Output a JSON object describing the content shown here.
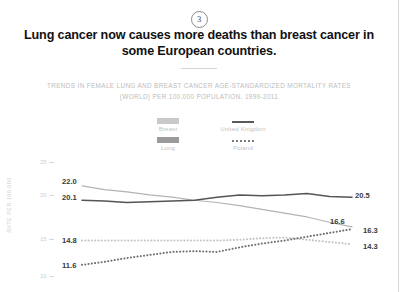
{
  "page": {
    "badge_number": "3",
    "title_line1": "Lung cancer now causes more deaths than breast cancer",
    "title_line2": "in some European countries.",
    "subtitle_line1": "TRENDS IN FEMALE LUNG AND BREAST CANCER AGE-STANDARDIZED MORTALITY RATES",
    "subtitle_line2": "(WORLD) PER 100,000 POPULATION, 1999-2011"
  },
  "legend": {
    "breast_label": "Breast",
    "lung_label": "Lung",
    "uk_label": "United Kingdom",
    "poland_label": "Poland"
  },
  "colors": {
    "breast_swatch": "#c9c9c9",
    "lung_swatch": "#9b9b9b",
    "uk_breast_line": "#b3b3b3",
    "uk_lung_line": "#555555",
    "poland_breast_line": "#c4c4c4",
    "poland_lung_line": "#6e6e6e",
    "axis": "#d8d8d8",
    "text": "#111111",
    "muted": "#c2c2c2"
  },
  "chart_data": {
    "type": "line",
    "title": "Trends in female lung and breast cancer age-standardized mortality rates",
    "xlabel": "",
    "ylabel": "RATE PER 100,000",
    "ylim": [
      9,
      26
    ],
    "yticks": [
      25,
      20,
      15,
      10
    ],
    "ytick_labels": [
      "25",
      "20",
      "15",
      "10"
    ],
    "grid": false,
    "legend_position": "top-center",
    "x": [
      1999,
      2000,
      2001,
      2002,
      2003,
      2004,
      2005,
      2006,
      2007,
      2008,
      2009,
      2010,
      2011
    ],
    "xlim": [
      1999,
      2011
    ],
    "series": [
      {
        "name": "United Kingdom Breast",
        "country": "United Kingdom",
        "cancer": "Breast",
        "style": "solid",
        "color": "#b3b3b3",
        "start_label": "22.0",
        "end_label": "16.6",
        "values": [
          22.0,
          21.5,
          21.2,
          20.8,
          20.5,
          20.1,
          19.8,
          19.4,
          18.9,
          18.4,
          17.9,
          17.2,
          16.6
        ]
      },
      {
        "name": "United Kingdom Lung",
        "country": "United Kingdom",
        "cancer": "Lung",
        "style": "solid",
        "color": "#555555",
        "start_label": "20.1",
        "end_label": "20.5",
        "values": [
          20.1,
          20.0,
          19.8,
          19.9,
          20.0,
          20.1,
          20.5,
          20.8,
          20.7,
          20.8,
          21.0,
          20.6,
          20.5
        ]
      },
      {
        "name": "Poland Breast",
        "country": "Poland",
        "cancer": "Breast",
        "style": "dotted",
        "color": "#c4c4c4",
        "start_label": "14.8",
        "end_label": "14.3",
        "values": [
          14.8,
          14.8,
          14.8,
          14.8,
          14.8,
          14.8,
          14.8,
          14.9,
          15.1,
          15.2,
          14.9,
          14.6,
          14.3
        ]
      },
      {
        "name": "Poland Lung",
        "country": "Poland",
        "cancer": "Lung",
        "style": "dotted",
        "color": "#6e6e6e",
        "start_label": "11.6",
        "end_label": "16.3",
        "values": [
          11.6,
          12.0,
          12.5,
          12.9,
          13.3,
          13.4,
          13.3,
          13.9,
          14.4,
          14.8,
          15.3,
          15.8,
          16.3
        ]
      }
    ]
  },
  "axis_labels": {
    "y25": "25",
    "y20": "20",
    "y15": "15",
    "y10": "10"
  }
}
